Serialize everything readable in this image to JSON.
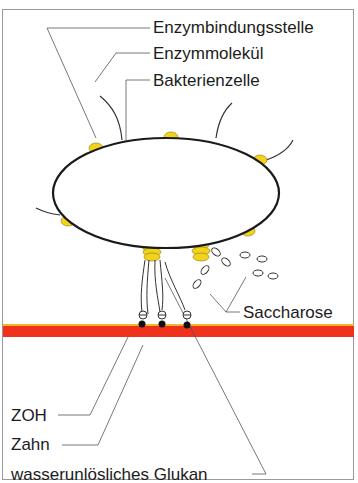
{
  "diagram": {
    "labels": {
      "enzyme_binding_site": "Enzymbindungsstelle",
      "enzyme_molecule": "Enzymmolekül",
      "bacterial_cell": "Bakterienzelle",
      "sucrose": "Saccharose",
      "zoh": "ZOH",
      "tooth": "Zahn",
      "insoluble_glucan": "wasserunlösliches Glukan"
    },
    "charge_symbol": "⊖",
    "colors": {
      "enzyme_yellow": "#f2d21a",
      "tooth_surface_red": "#f0321c",
      "tooth_surface_edge": "#f7b52a",
      "outline": "#1a1a1a",
      "leader_line": "#555555",
      "frame": "#9a9a9a"
    }
  }
}
